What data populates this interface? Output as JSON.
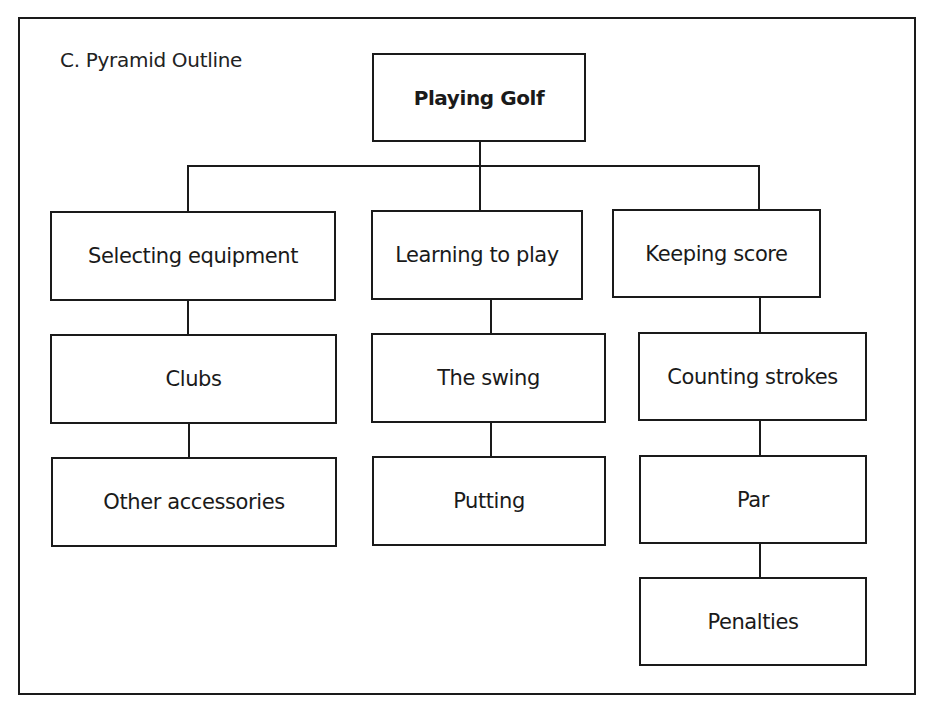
{
  "document": {
    "title": "C. Pyramid Outline"
  },
  "diagram": {
    "type": "tree",
    "root": {
      "label": "Playing Golf"
    },
    "branches": [
      {
        "label": "Selecting equipment",
        "children": [
          {
            "label": "Clubs"
          },
          {
            "label": "Other accessories"
          }
        ]
      },
      {
        "label": "Learning to play",
        "children": [
          {
            "label": "The swing"
          },
          {
            "label": "Putting"
          }
        ]
      },
      {
        "label": "Keeping score",
        "children": [
          {
            "label": "Counting strokes"
          },
          {
            "label": "Par"
          },
          {
            "label": "Penalties"
          }
        ]
      }
    ]
  },
  "colors": {
    "line": "#1a1a1a",
    "background": "#ffffff"
  }
}
